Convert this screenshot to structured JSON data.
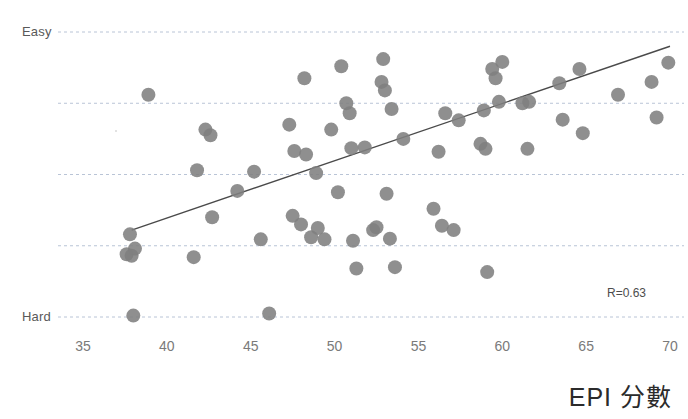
{
  "chart_data": {
    "type": "scatter",
    "title": "",
    "xlabel": "EPI 分數",
    "ylabel": "",
    "xlim": [
      35,
      70
    ],
    "ylim": [
      0,
      4
    ],
    "xticks": [
      35,
      40,
      45,
      50,
      55,
      60,
      65,
      70
    ],
    "xtick_labels": [
      "35",
      "40",
      "45",
      "50",
      "55",
      "60",
      "65",
      "70"
    ],
    "ytick_labels": [
      "Easy",
      "",
      "",
      "",
      "Hard"
    ],
    "y_top_label": "Easy",
    "y_bottom_label": "Hard",
    "grid": true,
    "gridlines_y": [
      4,
      3,
      2,
      1,
      0
    ],
    "legend": "none",
    "annotations": [
      {
        "text": "R=0.63",
        "x": 68.5,
        "y": 0.45
      }
    ],
    "marker_color": "#808080",
    "marker_size": 14,
    "trendline": {
      "visible": true,
      "color": "#4a4a4a",
      "x0": 37.9,
      "y0": 1.22,
      "x1": 70.0,
      "y1": 3.8,
      "r": 0.63
    },
    "points": [
      {
        "x": 37.8,
        "y": 1.16
      },
      {
        "x": 37.6,
        "y": 0.88
      },
      {
        "x": 37.9,
        "y": 0.86
      },
      {
        "x": 38.1,
        "y": 0.96
      },
      {
        "x": 38.0,
        "y": 0.02
      },
      {
        "x": 38.9,
        "y": 3.12
      },
      {
        "x": 41.6,
        "y": 0.84
      },
      {
        "x": 41.8,
        "y": 2.06
      },
      {
        "x": 42.3,
        "y": 2.63
      },
      {
        "x": 42.6,
        "y": 2.55
      },
      {
        "x": 42.7,
        "y": 1.4
      },
      {
        "x": 44.2,
        "y": 1.77
      },
      {
        "x": 45.2,
        "y": 2.04
      },
      {
        "x": 45.6,
        "y": 1.09
      },
      {
        "x": 46.1,
        "y": 0.05
      },
      {
        "x": 47.3,
        "y": 2.7
      },
      {
        "x": 47.5,
        "y": 1.42
      },
      {
        "x": 47.6,
        "y": 2.33
      },
      {
        "x": 48.0,
        "y": 1.3
      },
      {
        "x": 48.2,
        "y": 3.35
      },
      {
        "x": 48.3,
        "y": 2.28
      },
      {
        "x": 48.6,
        "y": 1.12
      },
      {
        "x": 48.9,
        "y": 2.02
      },
      {
        "x": 49.0,
        "y": 1.25
      },
      {
        "x": 49.4,
        "y": 1.09
      },
      {
        "x": 49.8,
        "y": 2.63
      },
      {
        "x": 50.2,
        "y": 1.75
      },
      {
        "x": 50.4,
        "y": 3.52
      },
      {
        "x": 50.7,
        "y": 3.0
      },
      {
        "x": 50.9,
        "y": 2.86
      },
      {
        "x": 51.0,
        "y": 2.37
      },
      {
        "x": 51.1,
        "y": 1.07
      },
      {
        "x": 51.3,
        "y": 0.68
      },
      {
        "x": 51.8,
        "y": 2.38
      },
      {
        "x": 52.3,
        "y": 1.22
      },
      {
        "x": 52.5,
        "y": 1.26
      },
      {
        "x": 52.8,
        "y": 3.3
      },
      {
        "x": 52.9,
        "y": 3.62
      },
      {
        "x": 53.0,
        "y": 3.18
      },
      {
        "x": 53.1,
        "y": 1.73
      },
      {
        "x": 53.3,
        "y": 1.1
      },
      {
        "x": 53.4,
        "y": 2.92
      },
      {
        "x": 53.6,
        "y": 0.7
      },
      {
        "x": 54.1,
        "y": 2.5
      },
      {
        "x": 55.9,
        "y": 1.52
      },
      {
        "x": 56.2,
        "y": 2.32
      },
      {
        "x": 56.4,
        "y": 1.28
      },
      {
        "x": 56.6,
        "y": 2.86
      },
      {
        "x": 57.1,
        "y": 1.22
      },
      {
        "x": 57.4,
        "y": 2.76
      },
      {
        "x": 58.7,
        "y": 2.43
      },
      {
        "x": 58.9,
        "y": 2.9
      },
      {
        "x": 59.0,
        "y": 2.36
      },
      {
        "x": 59.1,
        "y": 0.63
      },
      {
        "x": 59.4,
        "y": 3.48
      },
      {
        "x": 59.6,
        "y": 3.35
      },
      {
        "x": 59.8,
        "y": 3.02
      },
      {
        "x": 60.0,
        "y": 3.58
      },
      {
        "x": 61.2,
        "y": 3.0
      },
      {
        "x": 61.5,
        "y": 2.36
      },
      {
        "x": 61.6,
        "y": 3.02
      },
      {
        "x": 63.4,
        "y": 3.28
      },
      {
        "x": 63.6,
        "y": 2.77
      },
      {
        "x": 64.6,
        "y": 3.48
      },
      {
        "x": 64.8,
        "y": 2.58
      },
      {
        "x": 66.9,
        "y": 3.12
      },
      {
        "x": 68.9,
        "y": 3.3
      },
      {
        "x": 69.2,
        "y": 2.8
      },
      {
        "x": 69.9,
        "y": 3.57
      }
    ]
  },
  "overlay": {
    "faint_header": ""
  }
}
